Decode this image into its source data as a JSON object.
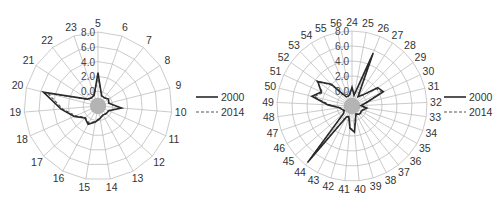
{
  "chart_data": [
    {
      "type": "radar",
      "title": "",
      "categories": [
        "5",
        "6",
        "7",
        "8",
        "9",
        "10",
        "11",
        "12",
        "13",
        "14",
        "15",
        "16",
        "17",
        "18",
        "19",
        "20",
        "21",
        "22",
        "23"
      ],
      "radial_ticks": [
        "0.0",
        "2.0",
        "4.0",
        "6.0",
        "8.0"
      ],
      "rlim": [
        -2,
        8
      ],
      "grid": true,
      "legend_position": "right",
      "series": [
        {
          "name": "2000",
          "style": "solid",
          "values": [
            2.5,
            -0.5,
            -0.6,
            -0.3,
            -0.5,
            1.2,
            -0.4,
            -0.5,
            -0.6,
            -0.3,
            0.2,
            0.8,
            0.4,
            1.5,
            3.0,
            5.6,
            -0.3,
            -0.6,
            -0.4
          ]
        },
        {
          "name": "2014",
          "style": "dashed",
          "values": [
            2.2,
            -0.6,
            -0.6,
            -0.4,
            -0.5,
            1.0,
            -0.5,
            -0.5,
            -0.6,
            -0.4,
            0.1,
            0.6,
            0.3,
            1.3,
            2.8,
            5.0,
            -0.4,
            -0.6,
            -0.5
          ]
        }
      ]
    },
    {
      "type": "radar",
      "title": "",
      "categories": [
        "24",
        "25",
        "26",
        "27",
        "28",
        "29",
        "30",
        "31",
        "32",
        "33",
        "34",
        "35",
        "36",
        "37",
        "38",
        "39",
        "40",
        "41",
        "42",
        "43",
        "44",
        "45",
        "46",
        "47",
        "48",
        "49",
        "50",
        "51",
        "52",
        "53",
        "54",
        "55",
        "56"
      ],
      "radial_ticks": [
        "0.0",
        "2.0",
        "4.0",
        "6.0",
        "8.0"
      ],
      "rlim": [
        -2,
        8
      ],
      "grid": true,
      "legend_position": "right",
      "series": [
        {
          "name": "2000",
          "style": "solid",
          "values": [
            0.5,
            -0.5,
            5.6,
            -0.5,
            0.0,
            2.2,
            2.6,
            0.0,
            -0.8,
            0.0,
            -0.4,
            -0.6,
            -0.5,
            -0.6,
            -0.8,
            -0.3,
            1.5,
            1.0,
            -0.5,
            -0.3,
            7.6,
            -0.5,
            -0.8,
            -0.6,
            -0.3,
            1.2,
            3.5,
            2.5,
            3.6,
            2.0,
            -0.5,
            -0.6,
            -0.4
          ]
        },
        {
          "name": "2014",
          "style": "dashed",
          "values": [
            0.4,
            -0.6,
            5.2,
            -0.6,
            -0.1,
            2.0,
            2.4,
            -0.1,
            -0.8,
            -0.1,
            -0.5,
            -0.6,
            -0.5,
            -0.6,
            -0.8,
            -0.4,
            1.3,
            0.9,
            -0.6,
            -0.4,
            7.2,
            -0.6,
            -0.8,
            -0.6,
            -0.4,
            1.0,
            3.2,
            2.3,
            3.8,
            1.8,
            -0.6,
            -0.6,
            -0.5
          ]
        }
      ]
    }
  ],
  "legend": {
    "items": [
      {
        "label": "2000",
        "style": "solid"
      },
      {
        "label": "2014",
        "style": "dashed"
      }
    ]
  },
  "charts": {
    "left": {
      "cx": 98,
      "cy": 106,
      "r": 74,
      "legend_x": 196,
      "legend_y": 97
    },
    "right": {
      "cx": 352,
      "cy": 106,
      "r": 75,
      "legend_x": 444,
      "legend_y": 97
    }
  }
}
